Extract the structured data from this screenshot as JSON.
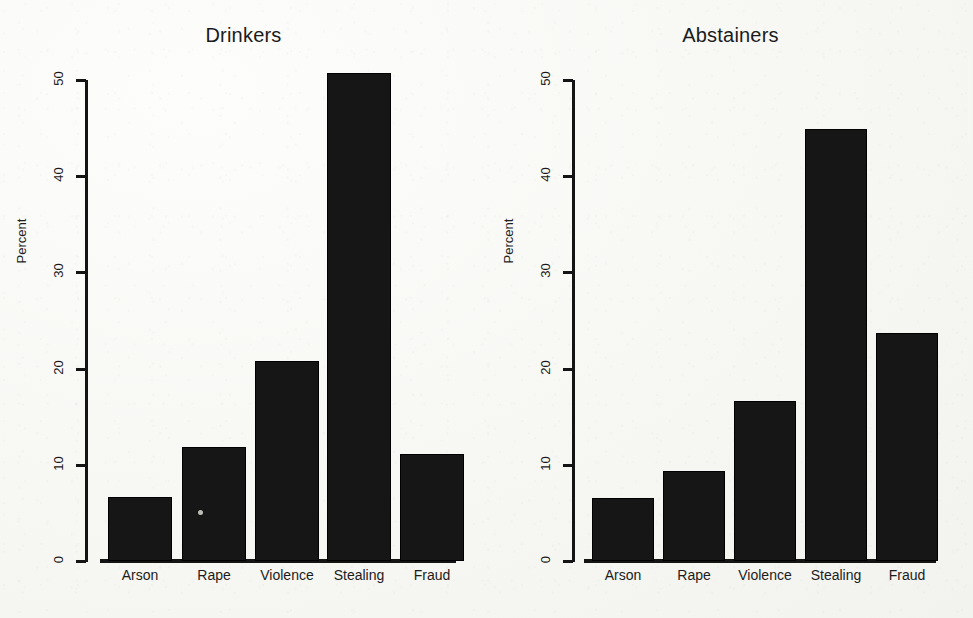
{
  "figure": {
    "background_color": "#f6f6f3",
    "ink_color": "#161616",
    "y_axis_title": "Percent",
    "y_ticks": [
      "0",
      "10",
      "20",
      "30",
      "40",
      "50"
    ]
  },
  "panels": [
    {
      "title": "Drinkers"
    },
    {
      "title": "Abstainers"
    }
  ],
  "chart_data": [
    {
      "type": "bar",
      "title": "Drinkers",
      "categories": [
        "Arson",
        "Rape",
        "Violence",
        "Stealing",
        "Fraud"
      ],
      "values": [
        6.7,
        11.9,
        20.8,
        50.7,
        11.1
      ],
      "xlabel": "",
      "ylabel": "Percent",
      "ylim": [
        0,
        50
      ],
      "yticks": [
        0,
        10,
        20,
        30,
        40,
        50
      ],
      "grid": false,
      "legend": "none",
      "bar_color": "#161616"
    },
    {
      "type": "bar",
      "title": "Abstainers",
      "categories": [
        "Arson",
        "Rape",
        "Violence",
        "Stealing",
        "Fraud"
      ],
      "values": [
        6.6,
        9.4,
        16.6,
        44.9,
        23.7
      ],
      "xlabel": "",
      "ylabel": "Percent",
      "ylim": [
        0,
        50
      ],
      "yticks": [
        0,
        10,
        20,
        30,
        40,
        50
      ],
      "grid": false,
      "legend": "none",
      "bar_color": "#161616"
    }
  ]
}
